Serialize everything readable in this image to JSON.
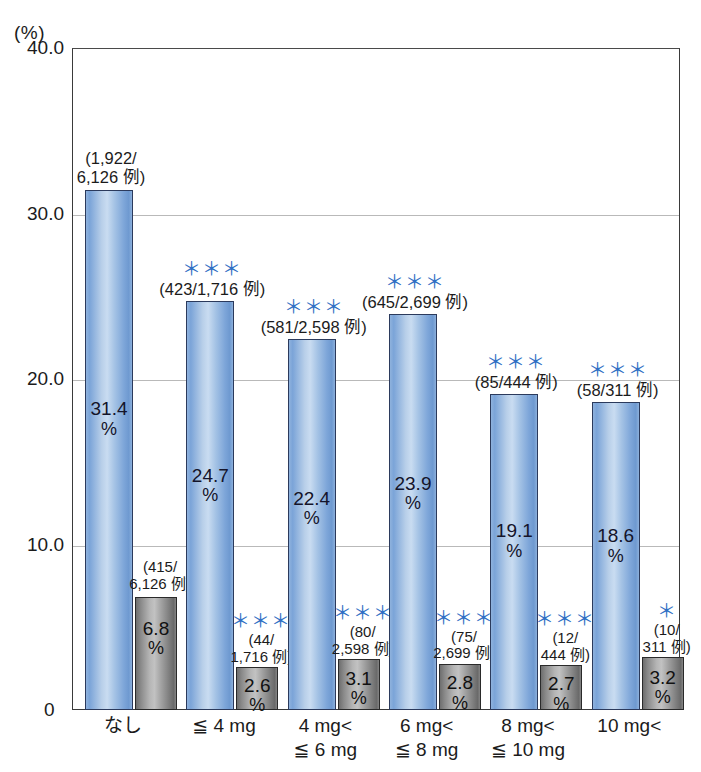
{
  "axis": {
    "unit_label": "(%)",
    "y_ticks": [
      "40.0",
      "30.0",
      "20.0",
      "10.0"
    ],
    "zero_label": "0",
    "y_min": 0,
    "y_max": 40
  },
  "chart_data": {
    "type": "bar",
    "title": "",
    "xlabel": "",
    "ylabel": "(%)",
    "ylim": [
      0,
      40
    ],
    "grid": true,
    "legend_position": "none",
    "categories": [
      "なし",
      "≦ 4 mg",
      "4 mg<\n≦ 6 mg",
      "6 mg<\n≦ 8 mg",
      "8 mg<\n≦ 10 mg",
      "10 mg<"
    ],
    "series": [
      {
        "name": "blue",
        "values": [
          31.4,
          24.7,
          22.4,
          23.9,
          19.1,
          18.6
        ],
        "value_labels": [
          "31.4",
          "24.7",
          "22.4",
          "23.9",
          "19.1",
          "18.6"
        ],
        "percent_sign": "%",
        "fractions": [
          "(1,922/\n6,126 例)",
          "(423/1,716 例)",
          "(581/2,598 例)",
          "(645/2,699 例)",
          "(85/444 例)",
          "(58/311 例)"
        ],
        "significance": [
          "",
          "＊＊＊",
          "＊＊＊",
          "＊＊＊",
          "＊＊＊",
          "＊＊＊"
        ]
      },
      {
        "name": "gray",
        "values": [
          6.8,
          2.6,
          3.1,
          2.8,
          2.7,
          3.2
        ],
        "value_labels": [
          "6.8",
          "2.6",
          "3.1",
          "2.8",
          "2.7",
          "3.2"
        ],
        "percent_sign": "%",
        "fractions": [
          "(415/\n6,126 例)",
          "(44/\n1,716 例)",
          "(80/\n2,598 例)",
          "(75/\n2,699 例)",
          "(12/\n444 例)",
          "(10/\n311 例)"
        ],
        "significance": [
          "",
          "＊＊＊",
          "＊＊＊",
          "＊＊＊",
          "＊＊＊",
          "＊"
        ]
      }
    ]
  },
  "colors": {
    "bar_blue": "#9dbce3",
    "bar_gray": "#9a9a9a",
    "significance": "#2f6fc4",
    "axis": "#3a3a3a",
    "gridline": "#b9b9b9",
    "text": "#1b1b1b"
  }
}
